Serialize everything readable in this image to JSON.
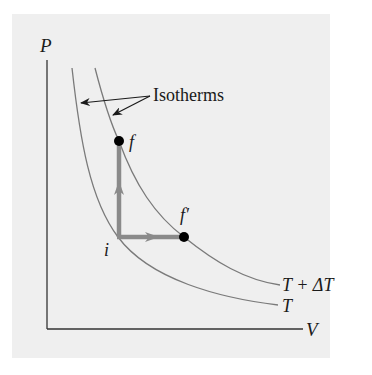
{
  "figure": {
    "type": "PV diagram",
    "axes": {
      "y_label": "P",
      "x_label": "V"
    },
    "callout": {
      "text": "Isotherms"
    },
    "isotherms": [
      {
        "name": "lower",
        "label": "T"
      },
      {
        "name": "upper",
        "label": "T + ΔT"
      }
    ],
    "points": {
      "i": {
        "label": "i"
      },
      "f": {
        "label": "f"
      },
      "f_prime": {
        "label": "f′"
      }
    },
    "paths": [
      {
        "from": "i",
        "to": "f",
        "direction": "vertical (constant volume)"
      },
      {
        "from": "i",
        "to": "f_prime",
        "direction": "horizontal (constant pressure)"
      }
    ],
    "colors": {
      "background": "#efefef",
      "axis": "#333333",
      "curve": "#7a7a7a",
      "path": "#8a8a8a",
      "point": "#000000",
      "text": "#1a1a1a"
    }
  }
}
